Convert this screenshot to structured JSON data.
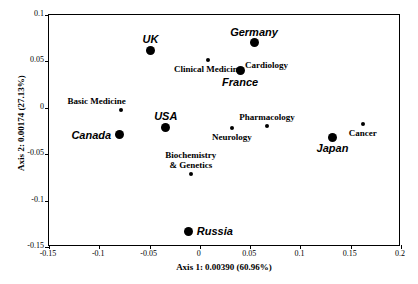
{
  "chart_data": {
    "type": "scatter",
    "title": "",
    "xlabel": "Axis 1: 0.00390 (60.96%)",
    "ylabel": "Axis 2: 0.00174 (27.13%)",
    "xlim": [
      -0.15,
      0.2
    ],
    "ylim": [
      -0.15,
      0.1
    ],
    "xticks": [
      "-0.15",
      "-0.1",
      "-0.05",
      "0",
      "0.05",
      "0.1",
      "0.15",
      "0.2"
    ],
    "xtick_values": [
      -0.15,
      -0.1,
      -0.05,
      0,
      0.05,
      0.1,
      0.15,
      0.2
    ],
    "yticks": [
      "0.1",
      "0.05",
      "0",
      "-0.05",
      "-0.1",
      "-0.15"
    ],
    "ytick_values": [
      0.1,
      0.05,
      0,
      -0.05,
      -0.1,
      -0.15
    ],
    "grid": false,
    "legend": "none",
    "series": [
      {
        "name": "Countries",
        "marker": "large-filled-circle",
        "label_style": "bold-italic-sans",
        "points": [
          {
            "label": "UK",
            "x": -0.049,
            "y": 0.062,
            "label_pos": "above"
          },
          {
            "label": "Germany",
            "x": 0.054,
            "y": 0.07,
            "label_pos": "above"
          },
          {
            "label": "France",
            "x": 0.04,
            "y": 0.04,
            "label_pos": "below"
          },
          {
            "label": "USA",
            "x": -0.034,
            "y": -0.021,
            "label_pos": "above"
          },
          {
            "label": "Canada",
            "x": -0.08,
            "y": -0.029,
            "label_pos": "left"
          },
          {
            "label": "Japan",
            "x": 0.132,
            "y": -0.032,
            "label_pos": "below"
          },
          {
            "label": "Russia",
            "x": -0.011,
            "y": -0.133,
            "label_pos": "right"
          }
        ]
      },
      {
        "name": "Research fields",
        "marker": "small-filled-circle",
        "label_style": "bold-serif",
        "points": [
          {
            "label": "Clinical Medicine",
            "x": 0.008,
            "y": 0.052,
            "label_pos": "below"
          },
          {
            "label": "Cardiology",
            "x": 0.04,
            "y": 0.04,
            "label_pos": "above-right"
          },
          {
            "label": "Basic Medicine",
            "x": -0.078,
            "y": -0.002,
            "label_pos": "above-left"
          },
          {
            "label": "Pharmacology",
            "x": 0.067,
            "y": -0.02,
            "label_pos": "above"
          },
          {
            "label": "Neurology",
            "x": 0.032,
            "y": -0.022,
            "label_pos": "below"
          },
          {
            "label": "Cancer",
            "x": 0.162,
            "y": -0.017,
            "label_pos": "below"
          },
          {
            "label": "Biochemistry & Genetics",
            "x": -0.009,
            "y": -0.071,
            "label_pos": "above",
            "lines": [
              "Biochemistry",
              "& Genetics"
            ]
          }
        ]
      }
    ]
  }
}
